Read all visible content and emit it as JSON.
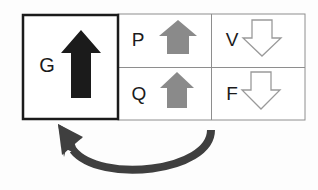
{
  "diagram": {
    "type": "block-arrow-feedback-diagram",
    "background_color": "#fdfdfd",
    "goal_box": {
      "label": "G",
      "border_color": "#1b1b1b",
      "border_width": 2.5,
      "fill": "#ffffff",
      "arrow": {
        "icon_name": "arrow-up-solid-black",
        "direction": "up",
        "style": "solid",
        "color": "#1b1b1b"
      }
    },
    "grid_border_color": "#8e8e8e",
    "cells": [
      {
        "label": "P",
        "row": 0,
        "col": 0,
        "arrow": {
          "icon_name": "arrow-up-solid-gray",
          "direction": "up",
          "style": "solid",
          "color": "#8a8a8a"
        }
      },
      {
        "label": "V",
        "row": 0,
        "col": 1,
        "arrow": {
          "icon_name": "arrow-down-outline",
          "direction": "down",
          "style": "outline",
          "color": "#ffffff",
          "outline_color": "#9a9a9a"
        }
      },
      {
        "label": "Q",
        "row": 1,
        "col": 0,
        "arrow": {
          "icon_name": "arrow-up-solid-gray",
          "direction": "up",
          "style": "solid",
          "color": "#8a8a8a"
        }
      },
      {
        "label": "F",
        "row": 1,
        "col": 1,
        "arrow": {
          "icon_name": "arrow-down-outline",
          "direction": "down",
          "style": "outline",
          "color": "#ffffff",
          "outline_color": "#9a9a9a"
        }
      }
    ],
    "feedback_arrow": {
      "icon_name": "curved-arrow-left-up",
      "direction": "right-to-left",
      "color": "#3f3f3f",
      "stroke_width": 8
    }
  }
}
